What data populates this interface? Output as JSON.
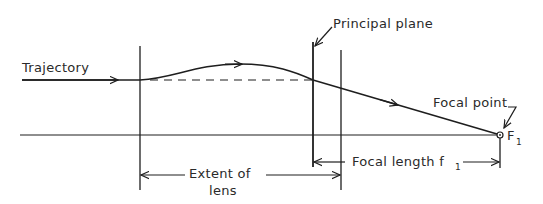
{
  "diagram": {
    "labels": {
      "trajectory": "Trajectory",
      "principal_plane": "Principal plane",
      "focal_point": "Focal point",
      "extent_line1": "Extent of",
      "extent_line2": "lens",
      "focal_length": "Focal length f",
      "focal_length_sub": "1",
      "focal_symbol": "F",
      "focal_symbol_sub": "1"
    },
    "colors": {
      "ink": "#1e1e1e",
      "background": "#ffffff"
    }
  }
}
